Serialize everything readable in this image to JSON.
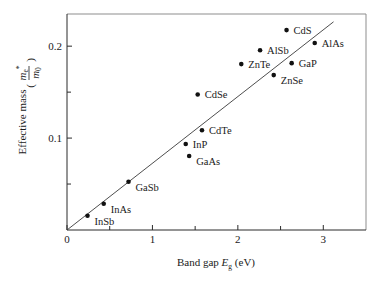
{
  "chart_data": {
    "type": "scatter",
    "title": "",
    "xlabel": "Band gap Eg (eV)",
    "ylabel": "Effective mass (m*e / m0)",
    "xlabel_parts": {
      "text": "Band gap ",
      "symbol": "E",
      "subscript": "g",
      "units": " (eV)"
    },
    "ylabel_parts": {
      "text": "Effective mass",
      "numerator": "m",
      "num_sub": "e",
      "num_sup": "*",
      "denominator": "m",
      "den_sub": "0"
    },
    "xlim": [
      0,
      3.5
    ],
    "ylim": [
      0,
      0.235
    ],
    "xticks": [
      0,
      1,
      2,
      3
    ],
    "xticklabels": [
      "0",
      "1",
      "2",
      "3"
    ],
    "xminorticks": [
      0.5,
      1.5,
      2.5
    ],
    "yticks": [
      0.1,
      0.2
    ],
    "yticklabels": [
      "0.1",
      "0.2"
    ],
    "yminorticks": [
      0.05,
      0.15
    ],
    "grid": false,
    "legend": "none",
    "marker": "filled-circle",
    "point_color": "#111111",
    "line_color": "#3a3a3a",
    "trendline": {
      "x": [
        0,
        3.12
      ],
      "y": [
        0,
        0.2265
      ]
    },
    "points": [
      {
        "label": "InSb",
        "x": 0.24,
        "y": 0.0155,
        "label_dx": 7,
        "label_dy": 9
      },
      {
        "label": "InAs",
        "x": 0.43,
        "y": 0.0285,
        "label_dx": 7,
        "label_dy": 9
      },
      {
        "label": "GaSb",
        "x": 0.72,
        "y": 0.0525,
        "label_dx": 7,
        "label_dy": 9
      },
      {
        "label": "GaAs",
        "x": 1.43,
        "y": 0.0805,
        "label_dx": 7,
        "label_dy": 9
      },
      {
        "label": "InP",
        "x": 1.39,
        "y": 0.0935,
        "label_dx": 7,
        "label_dy": 4
      },
      {
        "label": "CdTe",
        "x": 1.58,
        "y": 0.1085,
        "label_dx": 7,
        "label_dy": 4
      },
      {
        "label": "CdSe",
        "x": 1.53,
        "y": 0.1475,
        "label_dx": 7,
        "label_dy": 4
      },
      {
        "label": "ZnSe",
        "x": 2.42,
        "y": 0.1685,
        "label_dx": 7,
        "label_dy": 9
      },
      {
        "label": "ZnTe",
        "x": 2.04,
        "y": 0.1805,
        "label_dx": 7,
        "label_dy": 4
      },
      {
        "label": "GaP",
        "x": 2.63,
        "y": 0.1815,
        "label_dx": 7,
        "label_dy": 4
      },
      {
        "label": "AlSb",
        "x": 2.26,
        "y": 0.1955,
        "label_dx": 7,
        "label_dy": 4
      },
      {
        "label": "AlAs",
        "x": 2.9,
        "y": 0.2035,
        "label_dx": 7,
        "label_dy": 4
      },
      {
        "label": "CdS",
        "x": 2.57,
        "y": 0.2175,
        "label_dx": 7,
        "label_dy": 4
      }
    ]
  }
}
